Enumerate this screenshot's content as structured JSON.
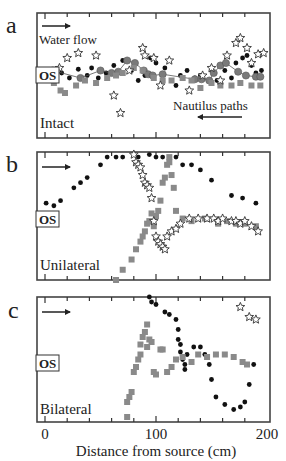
{
  "figure": {
    "x_axis": {
      "label": "Distance from source (cm)",
      "ticks": [
        "0",
        "100",
        "200"
      ]
    },
    "panels": [
      {
        "letter": "a",
        "condition": "Intact",
        "os_label": "OS",
        "annotations": {
          "flow": "Water flow",
          "paths": "Nautilus paths"
        }
      },
      {
        "letter": "b",
        "condition": "Unilateral",
        "os_label": "OS"
      },
      {
        "letter": "c",
        "condition": "Bilateral",
        "os_label": "OS"
      }
    ]
  },
  "chart_data": [
    {
      "type": "scatter",
      "title": "a",
      "condition": "Intact",
      "xlabel": "Distance from source (cm)",
      "ylabel": "",
      "xlim": [
        -7,
        202
      ],
      "ylim_note": "y = relative lateral position, 0 = top of frame, 100 = bottom",
      "annotations": [
        "Water flow →",
        "← Nautilus paths",
        "OS"
      ],
      "series": [
        {
          "name": "path 1 (black dots)",
          "marker": "dot",
          "x": [
            5,
            10,
            15,
            22,
            30,
            38,
            42,
            48,
            55,
            62,
            70,
            78,
            84,
            90,
            95,
            100,
            108,
            118,
            122,
            128,
            135,
            140,
            150,
            155,
            162,
            168,
            172,
            178,
            182,
            186,
            190,
            195
          ],
          "y": [
            46,
            50,
            48,
            52,
            45,
            50,
            44,
            52,
            48,
            42,
            38,
            46,
            54,
            50,
            36,
            40,
            44,
            58,
            50,
            46,
            52,
            50,
            46,
            54,
            46,
            52,
            40,
            36,
            34,
            42,
            48,
            46
          ]
        },
        {
          "name": "path 2 (grey circles, connected)",
          "marker": "circle",
          "connected": true,
          "x": [
            7,
            32,
            50,
            60,
            66,
            74,
            81,
            89,
            93,
            97,
            106,
            135,
            141,
            148,
            152,
            158,
            163,
            174,
            181,
            190,
            194
          ],
          "y": [
            46,
            52,
            46,
            48,
            47,
            38,
            40,
            46,
            49,
            50,
            49,
            53,
            53,
            54,
            48,
            42,
            40,
            47,
            50,
            51,
            51
          ]
        },
        {
          "name": "path 3 (grey squares)",
          "marker": "square",
          "x": [
            8,
            14,
            18,
            28,
            36,
            46,
            56,
            64,
            70,
            80,
            88,
            98,
            106,
            114,
            124,
            132,
            140,
            150,
            158,
            168,
            176,
            186,
            194
          ],
          "y": [
            56,
            62,
            64,
            58,
            54,
            56,
            52,
            50,
            48,
            44,
            46,
            52,
            54,
            54,
            52,
            54,
            60,
            56,
            58,
            58,
            56,
            58,
            58
          ]
        },
        {
          "name": "path 4 (stars)",
          "marker": "star",
          "x": [
            13,
            20,
            30,
            46,
            62,
            68,
            76,
            88,
            90,
            98,
            104,
            112,
            130,
            142,
            150,
            158,
            164,
            172,
            176,
            182,
            186,
            192,
            197
          ],
          "y": [
            44,
            36,
            32,
            34,
            66,
            80,
            46,
            28,
            34,
            36,
            58,
            38,
            62,
            50,
            44,
            54,
            34,
            24,
            20,
            28,
            40,
            33,
            32
          ]
        }
      ]
    },
    {
      "type": "scatter",
      "title": "b",
      "condition": "Unilateral",
      "xlabel": "Distance from source (cm)",
      "xlim": [
        -7,
        202
      ],
      "ylim_note": "y = relative lateral position, 0 = top of frame, 100 = bottom",
      "annotations": [
        "→",
        "OS"
      ],
      "series": [
        {
          "name": "path 1 (black dots)",
          "marker": "dot",
          "x": [
            1,
            8,
            14,
            26,
            32,
            38,
            50,
            56,
            64,
            70,
            84,
            94,
            100,
            106,
            118,
            124,
            132,
            140,
            150,
            168,
            178,
            190
          ],
          "y": [
            40,
            42,
            38,
            28,
            24,
            20,
            10,
            4,
            4,
            4,
            4,
            2,
            4,
            4,
            4,
            10,
            10,
            14,
            22,
            34,
            36,
            40
          ]
        },
        {
          "name": "path 2 (grey squares)",
          "marker": "square",
          "x": [
            64,
            70,
            78,
            82,
            86,
            88,
            90,
            92,
            94,
            96,
            98,
            100,
            102,
            104,
            106,
            108,
            110,
            112,
            112,
            114,
            116,
            118,
            124,
            132,
            144,
            156,
            164,
            172,
            180,
            190
          ],
          "y": [
            100,
            92,
            84,
            76,
            70,
            66,
            62,
            56,
            54,
            48,
            58,
            50,
            46,
            38,
            24,
            20,
            10,
            8,
            4,
            18,
            28,
            46,
            52,
            54,
            52,
            56,
            54,
            56,
            56,
            58
          ]
        },
        {
          "name": "path 3 (stars)",
          "marker": "star",
          "x": [
            80,
            82,
            84,
            86,
            88,
            90,
            92,
            94,
            96,
            98,
            100,
            102,
            104,
            106,
            108,
            110,
            114,
            118,
            122,
            130,
            138,
            146,
            152,
            156,
            160,
            168,
            172,
            176,
            180,
            186,
            192
          ],
          "y": [
            2,
            8,
            10,
            12,
            18,
            24,
            26,
            28,
            36,
            54,
            66,
            70,
            72,
            74,
            76,
            66,
            62,
            60,
            56,
            52,
            52,
            52,
            52,
            54,
            52,
            54,
            54,
            56,
            54,
            58,
            62
          ]
        }
      ]
    },
    {
      "type": "scatter",
      "title": "c",
      "condition": "Bilateral",
      "xlabel": "Distance from source (cm)",
      "xlim": [
        -7,
        202
      ],
      "ylim_note": "y = relative lateral position, 0 = top of frame, 100 = bottom",
      "annotations": [
        "→",
        "OS"
      ],
      "series": [
        {
          "name": "path 1 (black dots)",
          "marker": "dot",
          "x": [
            94,
            96,
            100,
            108,
            112,
            118,
            120,
            120,
            122,
            122,
            124,
            126,
            126,
            128,
            134,
            140,
            144,
            148,
            150,
            154,
            162,
            170,
            176,
            180,
            184,
            188
          ],
          "y": [
            0,
            4,
            6,
            12,
            14,
            18,
            26,
            34,
            38,
            44,
            50,
            54,
            58,
            46,
            40,
            40,
            46,
            54,
            66,
            80,
            86,
            90,
            88,
            84,
            70,
            54
          ]
        },
        {
          "name": "path 2 (grey squares)",
          "marker": "square",
          "x": [
            74,
            74,
            76,
            78,
            80,
            82,
            84,
            86,
            86,
            88,
            90,
            92,
            92,
            94,
            96,
            98,
            100,
            104,
            106,
            110,
            114,
            118,
            124,
            132,
            138,
            146,
            154,
            162,
            170,
            178,
            182
          ],
          "y": [
            96,
            84,
            80,
            76,
            60,
            56,
            50,
            46,
            38,
            32,
            28,
            22,
            40,
            34,
            36,
            60,
            62,
            42,
            42,
            60,
            56,
            50,
            48,
            52,
            46,
            48,
            46,
            46,
            48,
            52,
            54
          ]
        },
        {
          "name": "path 3 (stars)",
          "marker": "star",
          "x": [
            176,
            184,
            190
          ],
          "y": [
            8,
            16,
            18
          ]
        }
      ]
    }
  ]
}
